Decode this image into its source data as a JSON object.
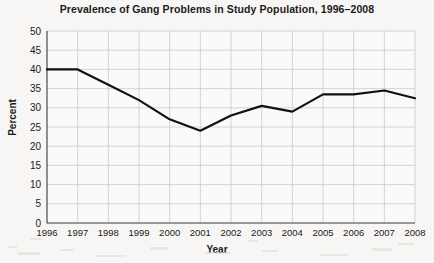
{
  "chart_data": {
    "type": "line",
    "title": "Prevalence of Gang Problems in Study Population, 1996–2008",
    "xlabel": "Year",
    "ylabel": "Percent",
    "categories": [
      "1996",
      "1997",
      "1998",
      "1999",
      "2000",
      "2001",
      "2002",
      "2003",
      "2004",
      "2005",
      "2006",
      "2007",
      "2008"
    ],
    "x": [
      1996,
      1997,
      1998,
      1999,
      2000,
      2001,
      2002,
      2003,
      2004,
      2005,
      2006,
      2007,
      2008
    ],
    "values": [
      40,
      40,
      36,
      32,
      27,
      24,
      28,
      30.5,
      29,
      33.5,
      33.5,
      34.5,
      32.5
    ],
    "series": [
      {
        "name": "Prevalence of gang problems",
        "values": [
          40,
          40,
          36,
          32,
          27,
          24,
          28,
          30.5,
          29,
          33.5,
          33.5,
          34.5,
          32.5
        ]
      }
    ],
    "ylim": [
      0,
      50
    ],
    "ytick_values": [
      0,
      5,
      10,
      15,
      20,
      25,
      30,
      35,
      40,
      45,
      50
    ],
    "ytick_labels": [
      "0",
      "5",
      "10",
      "15",
      "20",
      "25",
      "30",
      "35",
      "40",
      "45",
      "50"
    ],
    "xtick_labels": [
      "1996",
      "1997",
      "1998",
      "1999",
      "2000",
      "2001",
      "2002",
      "2003",
      "2004",
      "2005",
      "2006",
      "2007",
      "2008"
    ],
    "grid": true,
    "legend": false,
    "legend_position": "none",
    "line_color": "#111111",
    "grid_color": "#c9c9c9",
    "axis_color": "#3a3a3a",
    "background_color": "#f7f6f4"
  }
}
